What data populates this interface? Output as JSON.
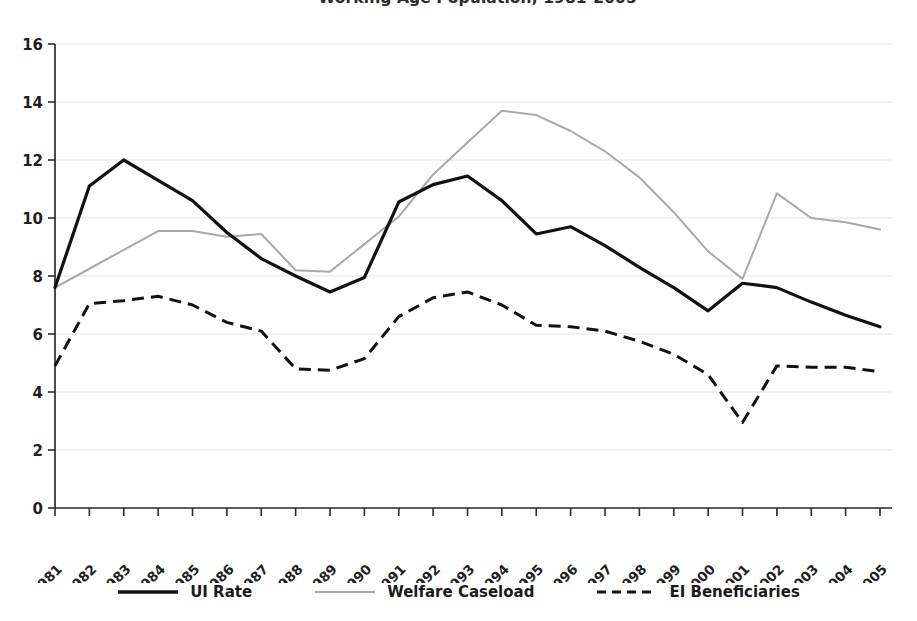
{
  "chart_data": {
    "type": "line",
    "title": "Working Age Population, 1981-2005",
    "xlabel": "",
    "ylabel": "",
    "ylim": [
      0,
      16
    ],
    "yticks": [
      0,
      2,
      4,
      6,
      8,
      10,
      12,
      14,
      16
    ],
    "grid": true,
    "legend_position": "bottom",
    "categories": [
      "1981",
      "1982",
      "1983",
      "1984",
      "1985",
      "1986",
      "1987",
      "1988",
      "1989",
      "1990",
      "1991",
      "1992",
      "1993",
      "1994",
      "1995",
      "1996",
      "1997",
      "1998",
      "1999",
      "2000",
      "2001",
      "2002",
      "2003",
      "2004",
      "2005"
    ],
    "series": [
      {
        "name": "UI Rate",
        "style": "solid",
        "color": "#111111",
        "values": [
          7.6,
          11.1,
          12.0,
          11.3,
          10.6,
          9.5,
          8.6,
          8.0,
          7.45,
          7.95,
          10.55,
          11.15,
          11.45,
          10.6,
          9.45,
          9.7,
          9.05,
          8.3,
          7.6,
          6.8,
          7.75,
          7.6,
          7.1,
          6.65,
          6.25
        ]
      },
      {
        "name": "Welfare Caseload",
        "style": "solid",
        "color": "#a9a9a9",
        "values": [
          7.6,
          8.25,
          8.9,
          9.55,
          9.55,
          9.35,
          9.45,
          8.2,
          8.15,
          9.1,
          10.05,
          11.5,
          12.6,
          13.7,
          13.55,
          13.0,
          12.3,
          11.4,
          10.2,
          8.85,
          7.9,
          10.85,
          10.0,
          9.85,
          9.6
        ]
      },
      {
        "name": "EI Beneficiaries",
        "style": "dashed",
        "color": "#111111",
        "values": [
          4.9,
          7.05,
          7.15,
          7.3,
          7.0,
          6.4,
          6.1,
          4.8,
          4.75,
          5.15,
          6.6,
          7.25,
          7.45,
          7.0,
          6.3,
          6.25,
          6.1,
          5.75,
          5.3,
          4.6,
          2.95,
          4.9,
          4.85,
          4.85,
          4.7
        ]
      }
    ]
  },
  "legend": {
    "items": [
      {
        "label": "UI Rate",
        "swatch": "solid-black-line-icon"
      },
      {
        "label": "Welfare Caseload",
        "swatch": "solid-gray-line-icon"
      },
      {
        "label": "EI Beneficiaries",
        "swatch": "dashed-black-line-icon"
      }
    ]
  },
  "colors": {
    "ui_rate": "#111111",
    "welfare_caseload": "#a9a9a9",
    "ei_beneficiaries": "#111111",
    "grid": "#dcdcdc",
    "axis": "#2b2b2b",
    "background": "#ffffff"
  }
}
